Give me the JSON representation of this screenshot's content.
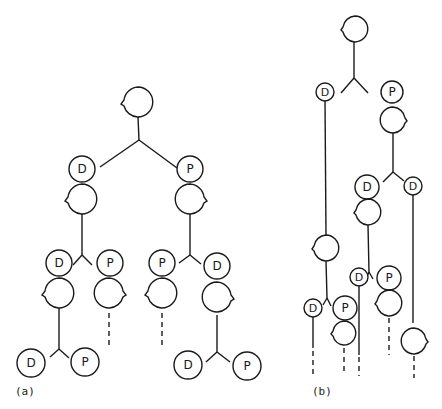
{
  "figure": {
    "panels": [
      {
        "id": "a",
        "label": "(a)",
        "description": "Symmetric division tree: each stem cell divides into a D (daughter) and P (parent) cell; each grows and divides again."
      },
      {
        "id": "b",
        "label": "(b)",
        "description": "Asymmetric lineage: D cells grow long before dividing while P cells divide promptly."
      }
    ],
    "cell_labels": {
      "daughter": "D",
      "parent": "P"
    },
    "colors": {
      "ink": "#1a1a1a",
      "background": "#ffffff"
    }
  },
  "panel_a": {
    "label": "(a)",
    "nodes": [
      {
        "name": "root-blob",
        "type": "blob",
        "x": 138,
        "y": 102,
        "r": 15,
        "bump": "left"
      },
      {
        "name": "d1",
        "type": "cell",
        "label": "D",
        "x": 82,
        "y": 169,
        "r": 13
      },
      {
        "name": "d1-blob",
        "type": "blob",
        "x": 82,
        "y": 199,
        "r": 15,
        "bump": "left"
      },
      {
        "name": "p1",
        "type": "cell",
        "label": "P",
        "x": 190,
        "y": 169,
        "r": 13
      },
      {
        "name": "p1-blob",
        "type": "blob",
        "x": 190,
        "y": 199,
        "r": 15,
        "bump": "right"
      },
      {
        "name": "d2",
        "type": "cell",
        "label": "D",
        "x": 59,
        "y": 263,
        "r": 13
      },
      {
        "name": "d2-blob",
        "type": "blob",
        "x": 59,
        "y": 293,
        "r": 15,
        "bump": "left"
      },
      {
        "name": "p2",
        "type": "cell",
        "label": "P",
        "x": 110,
        "y": 263,
        "r": 13
      },
      {
        "name": "p2-blob",
        "type": "blob",
        "x": 109,
        "y": 293,
        "r": 15,
        "bump": "right"
      },
      {
        "name": "p3",
        "type": "cell",
        "label": "P",
        "x": 162,
        "y": 263,
        "r": 13
      },
      {
        "name": "p3-blob",
        "type": "blob",
        "x": 162,
        "y": 293,
        "r": 15,
        "bump": "left"
      },
      {
        "name": "d3",
        "type": "cell",
        "label": "D",
        "x": 217,
        "y": 266,
        "r": 13
      },
      {
        "name": "d3-blob",
        "type": "blob",
        "x": 217,
        "y": 297,
        "r": 15,
        "bump": "right"
      },
      {
        "name": "d4",
        "type": "cell",
        "label": "D",
        "x": 31,
        "y": 363,
        "r": 14
      },
      {
        "name": "p4",
        "type": "cell",
        "label": "P",
        "x": 85,
        "y": 362,
        "r": 14
      },
      {
        "name": "d5",
        "type": "cell",
        "label": "D",
        "x": 188,
        "y": 365,
        "r": 14
      },
      {
        "name": "p5",
        "type": "cell",
        "label": "P",
        "x": 247,
        "y": 366,
        "r": 14
      }
    ]
  },
  "panel_b": {
    "label": "(b)",
    "nodes": [
      {
        "name": "root-blob",
        "type": "blob",
        "x": 355,
        "y": 29,
        "r": 13,
        "bump": "left"
      },
      {
        "name": "d1",
        "type": "cell",
        "label": "D",
        "x": 325,
        "y": 92,
        "r": 9
      },
      {
        "name": "p1",
        "type": "cell",
        "label": "P",
        "x": 392,
        "y": 92,
        "r": 11
      },
      {
        "name": "p1-blob",
        "type": "blob",
        "x": 393,
        "y": 120,
        "r": 13,
        "bump": "right"
      },
      {
        "name": "d2",
        "type": "cell",
        "label": "D",
        "x": 367,
        "y": 187,
        "r": 12
      },
      {
        "name": "d2-blob",
        "type": "blob",
        "x": 368,
        "y": 212,
        "r": 13,
        "bump": "left"
      },
      {
        "name": "d3",
        "type": "cell",
        "label": "D",
        "x": 413,
        "y": 186,
        "r": 9
      },
      {
        "name": "d1-blob",
        "type": "blob",
        "x": 326,
        "y": 248,
        "r": 13,
        "bump": "left"
      },
      {
        "name": "d4",
        "type": "cell",
        "label": "D",
        "x": 359,
        "y": 277,
        "r": 9
      },
      {
        "name": "p4",
        "type": "cell",
        "label": "P",
        "x": 389,
        "y": 278,
        "r": 12
      },
      {
        "name": "p4-blob",
        "type": "blob",
        "x": 389,
        "y": 303,
        "r": 13,
        "bump": "left"
      },
      {
        "name": "d5",
        "type": "cell",
        "label": "D",
        "x": 313,
        "y": 308,
        "r": 9
      },
      {
        "name": "p5",
        "type": "cell",
        "label": "P",
        "x": 345,
        "y": 308,
        "r": 12
      },
      {
        "name": "p5-blob",
        "type": "blob",
        "x": 344,
        "y": 333,
        "r": 12,
        "bump": "left"
      },
      {
        "name": "d3-blob",
        "type": "blob",
        "x": 414,
        "y": 341,
        "r": 13,
        "bump": "right"
      }
    ]
  }
}
